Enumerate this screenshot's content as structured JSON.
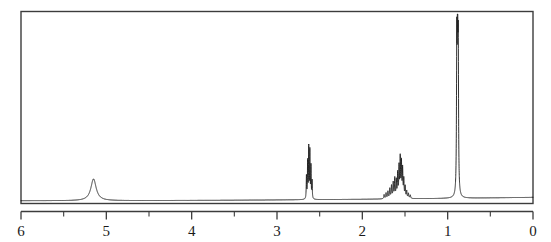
{
  "figure": {
    "kind": "nmr-spectrum",
    "title": "",
    "background_color": "#ffffff",
    "frame_color": "#3c3c3c",
    "trace_color": "#1c1c1c"
  },
  "chart_data": {
    "type": "line",
    "title": "",
    "xlabel": "",
    "ylabel": "",
    "xlim": [
      6,
      0
    ],
    "ylim": [
      0,
      1
    ],
    "grid": false,
    "legend": null,
    "axis": {
      "direction": "reversed",
      "major_ticks": [
        6,
        5,
        4,
        3,
        2,
        1,
        0
      ],
      "major_tick_labels": [
        "6",
        "5",
        "4",
        "3",
        "2",
        "1",
        "0"
      ],
      "minor_ticks": [
        5.5,
        4.5,
        3.5,
        2.5,
        1.5,
        0.5
      ]
    },
    "baseline": {
      "left_value": 0.012,
      "right_value": 0.03,
      "description": "slight rising baseline from 6 ppm toward 0 ppm"
    },
    "peaks": [
      {
        "label": "broad singlet",
        "shift": 5.15,
        "height": 0.115,
        "width": 0.075,
        "shape": "lorentzian",
        "lines": [
          {
            "shift": 5.15,
            "height": 0.115,
            "width": 0.075
          }
        ]
      },
      {
        "label": "multiplet",
        "shift": 2.62,
        "height": 0.275,
        "width": 0.007,
        "shape": "multiplet",
        "lines": [
          {
            "shift": 2.655,
            "height": 0.12,
            "width": 0.006
          },
          {
            "shift": 2.641,
            "height": 0.195,
            "width": 0.006
          },
          {
            "shift": 2.628,
            "height": 0.268,
            "width": 0.006
          },
          {
            "shift": 2.615,
            "height": 0.25,
            "width": 0.006
          },
          {
            "shift": 2.602,
            "height": 0.17,
            "width": 0.006
          },
          {
            "shift": 2.589,
            "height": 0.095,
            "width": 0.006
          }
        ]
      },
      {
        "label": "complex multiplet",
        "shift": 1.56,
        "height": 0.205,
        "width": 0.01,
        "shape": "multiplet",
        "lines": [
          {
            "shift": 1.745,
            "height": 0.022,
            "width": 0.009
          },
          {
            "shift": 1.722,
            "height": 0.03,
            "width": 0.009
          },
          {
            "shift": 1.7,
            "height": 0.038,
            "width": 0.009
          },
          {
            "shift": 1.678,
            "height": 0.052,
            "width": 0.009
          },
          {
            "shift": 1.658,
            "height": 0.066,
            "width": 0.009
          },
          {
            "shift": 1.638,
            "height": 0.082,
            "width": 0.009
          },
          {
            "shift": 1.62,
            "height": 0.104,
            "width": 0.008
          },
          {
            "shift": 1.602,
            "height": 0.092,
            "width": 0.008
          },
          {
            "shift": 1.586,
            "height": 0.128,
            "width": 0.008
          },
          {
            "shift": 1.57,
            "height": 0.16,
            "width": 0.008
          },
          {
            "shift": 1.556,
            "height": 0.205,
            "width": 0.008
          },
          {
            "shift": 1.542,
            "height": 0.182,
            "width": 0.008
          },
          {
            "shift": 1.528,
            "height": 0.15,
            "width": 0.008
          },
          {
            "shift": 1.514,
            "height": 0.096,
            "width": 0.008
          },
          {
            "shift": 1.498,
            "height": 0.06,
            "width": 0.008
          },
          {
            "shift": 1.48,
            "height": 0.038,
            "width": 0.009
          },
          {
            "shift": 1.46,
            "height": 0.026,
            "width": 0.009
          },
          {
            "shift": 1.438,
            "height": 0.018,
            "width": 0.01
          }
        ]
      },
      {
        "label": "tall sharp peak",
        "shift": 0.885,
        "height": 0.955,
        "width": 0.009,
        "shape": "lorentzian",
        "lines": [
          {
            "shift": 0.893,
            "height": 0.76,
            "width": 0.008
          },
          {
            "shift": 0.884,
            "height": 0.955,
            "width": 0.008
          },
          {
            "shift": 0.876,
            "height": 0.7,
            "width": 0.008
          }
        ]
      }
    ]
  }
}
